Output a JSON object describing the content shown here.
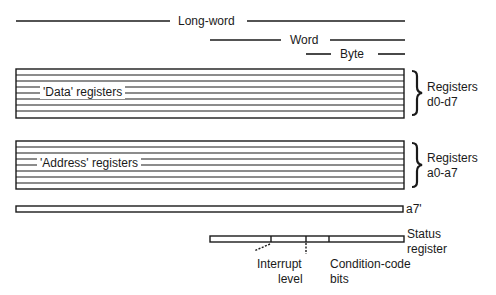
{
  "diagram": {
    "widths": {
      "long_word": "Long-word",
      "word": "Word",
      "byte": "Byte"
    },
    "data_registers": {
      "inner_label": "'Data' registers",
      "side_label_line1": "Registers",
      "side_label_line2": "d0-d7",
      "count": 8
    },
    "address_registers": {
      "inner_label": "'Address' registers",
      "side_label_line1": "Registers",
      "side_label_line2": "a0-a7",
      "count": 8
    },
    "supervisor_stack": {
      "label": "a7'"
    },
    "status_register": {
      "label_line1": "Status",
      "label_line2": "register",
      "interrupt_label_line1": "Interrupt",
      "interrupt_label_line2": "level",
      "ccr_label_line1": "Condition-code",
      "ccr_label_line2": "bits"
    },
    "colors": {
      "ink": "#1a1a1a",
      "background": "#ffffff"
    }
  }
}
